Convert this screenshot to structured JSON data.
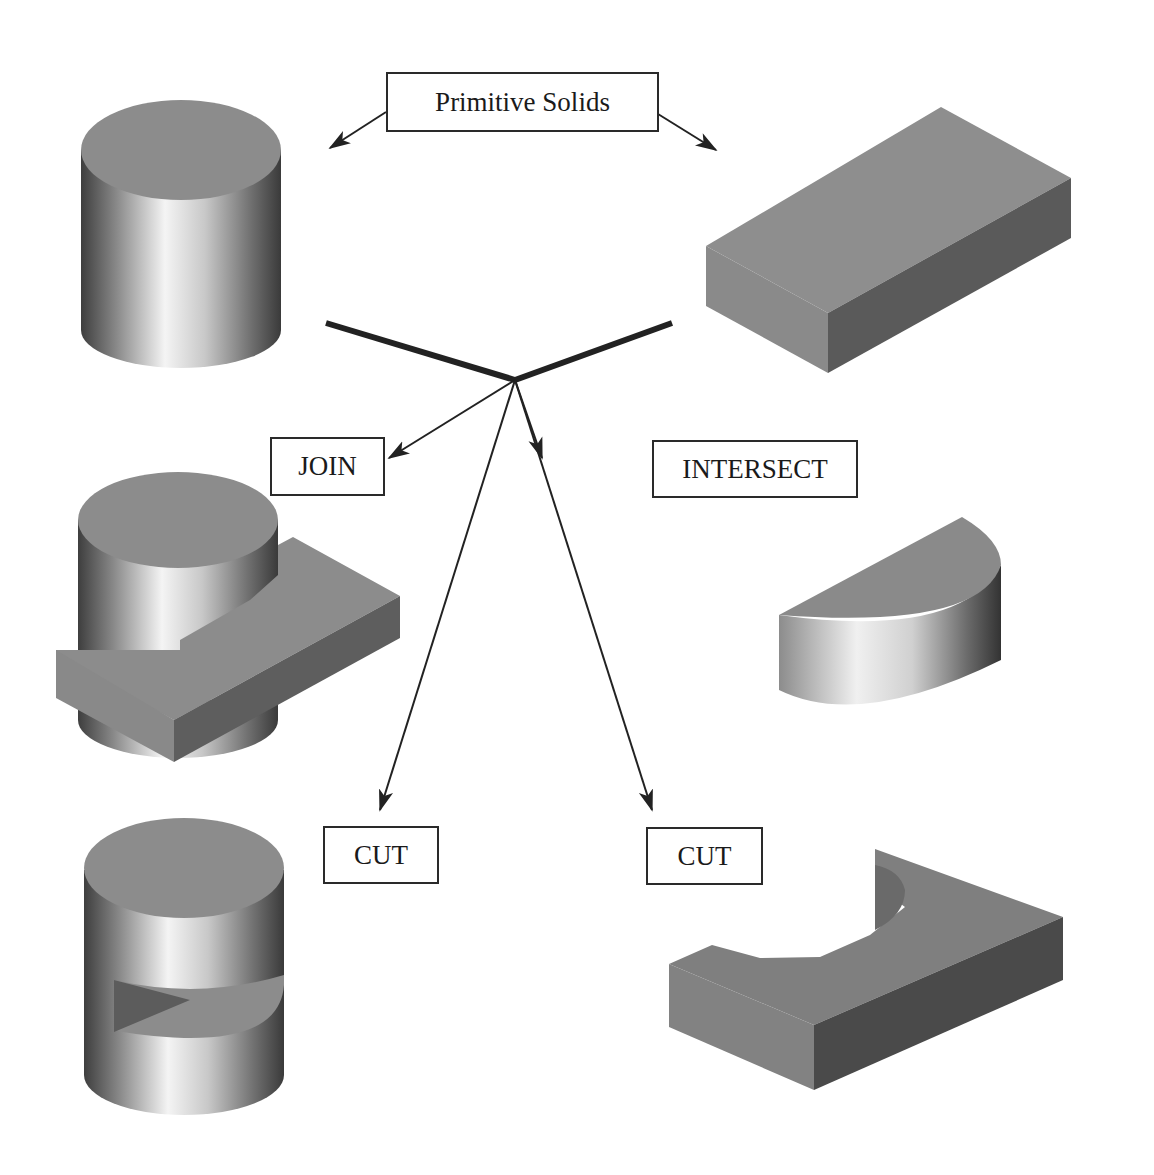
{
  "diagram": {
    "title": "Primitive Solids",
    "operations": [
      {
        "id": "join",
        "label": "JOIN",
        "result": "cylinder joined with rectangular block"
      },
      {
        "id": "intersect",
        "label": "INTERSECT",
        "result": "half-cylinder segment"
      },
      {
        "id": "cut-1",
        "label": "CUT",
        "result": "cylinder with wedge slot cut"
      },
      {
        "id": "cut-2",
        "label": "CUT",
        "result": "block with semicircular cutout"
      }
    ],
    "primitives": [
      {
        "id": "cylinder",
        "name": "Cylinder"
      },
      {
        "id": "box",
        "name": "Rectangular block"
      }
    ]
  },
  "colors": {
    "top_face": "#8a8a8a",
    "side_face_light": "#909090",
    "side_face_dark": "#5c5c5c",
    "line": "#222222",
    "background": "#ffffff"
  }
}
